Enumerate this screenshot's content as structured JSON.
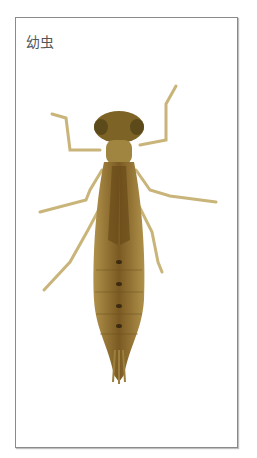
{
  "caption": {
    "label": "幼虫"
  },
  "image": {
    "subject": "dragonfly-larva",
    "colors": {
      "body": "#8a6a2a",
      "body_dark": "#5a4418",
      "legs": "#c9b47a",
      "frame_border": "#8a8a8a"
    }
  }
}
